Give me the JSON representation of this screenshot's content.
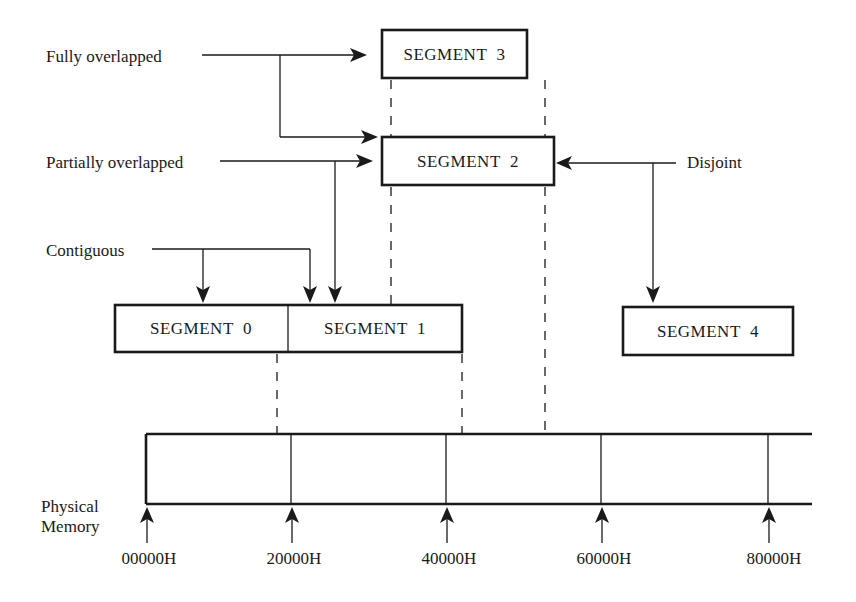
{
  "diagram": {
    "segments": [
      {
        "id": "seg0",
        "label": "SEGMENT  0"
      },
      {
        "id": "seg1",
        "label": "SEGMENT  1"
      },
      {
        "id": "seg2",
        "label": "SEGMENT  2"
      },
      {
        "id": "seg3",
        "label": "SEGMENT  3"
      },
      {
        "id": "seg4",
        "label": "SEGMENT  4"
      }
    ],
    "relationship_labels": {
      "fully_overlapped": "Fully overlapped",
      "partially_overlapped": "Partially overlapped",
      "contiguous": "Contiguous",
      "disjoint": "Disjoint"
    },
    "memory": {
      "label_line1": "Physical",
      "label_line2": "Memory",
      "addresses": [
        "00000H",
        "20000H",
        "40000H",
        "60000H",
        "80000H"
      ]
    },
    "edges": [
      {
        "from": "Fully overlapped",
        "to": "SEGMENT 3"
      },
      {
        "from": "Fully overlapped",
        "to": "SEGMENT 2"
      },
      {
        "from": "Partially overlapped",
        "to": "SEGMENT 2"
      },
      {
        "from": "Partially overlapped",
        "to": "SEGMENT 1"
      },
      {
        "from": "Contiguous",
        "to": "SEGMENT 0"
      },
      {
        "from": "Contiguous",
        "to": "SEGMENT 1"
      },
      {
        "from": "Disjoint",
        "to": "SEGMENT 2"
      },
      {
        "from": "Disjoint",
        "to": "SEGMENT 4"
      }
    ],
    "colors": {
      "ink": "#1a1a1a",
      "background": "#ffffff"
    }
  }
}
